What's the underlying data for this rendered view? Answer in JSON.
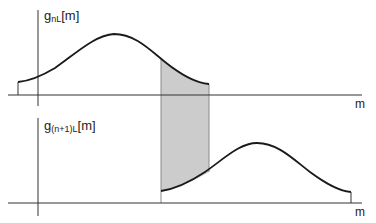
{
  "diagram": {
    "top_plot": {
      "ylabel_base": "g",
      "ylabel_sub": "nL",
      "ylabel_arg": "[m]",
      "xlabel": "m"
    },
    "bottom_plot": {
      "ylabel_base": "g",
      "ylabel_sub": "(n+1)L",
      "ylabel_arg": "[m]",
      "xlabel": "m"
    },
    "colors": {
      "line": "#1a1a1a",
      "axis": "#333333",
      "overlap_fill": "#cccccc",
      "background": "#ffffff"
    },
    "overlap_region": "shaded overlap between window g_nL[m] and g_(n+1)L[m]"
  }
}
